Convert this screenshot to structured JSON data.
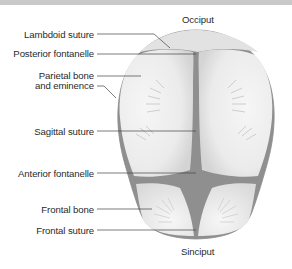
{
  "figure": {
    "colors": {
      "bone_fill": "#ececec",
      "bone_shadow": "#d6d6d6",
      "fontanelle": "#8f8f8f",
      "outline": "#8a8a8a",
      "leader_line": "#444444",
      "top_bar": "#c9c9c9"
    },
    "labels": {
      "occiput": "Occiput",
      "lambdoid_suture": "Lambdoid suture",
      "posterior_fontanelle": "Posterior fontanelle",
      "parietal_line1": "Parietal bone",
      "parietal_line2": "and eminence",
      "sagittal_suture": "Sagittal suture",
      "anterior_fontanelle": "Anterior fontanelle",
      "frontal_bone": "Frontal bone",
      "frontal_suture": "Frontal suture",
      "sinciput": "Sinciput"
    }
  }
}
